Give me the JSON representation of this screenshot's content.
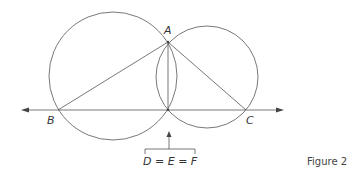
{
  "labels": {
    "A": "A",
    "B": "B",
    "C": "C",
    "equation": "D = E = F"
  },
  "caption": "Figure 2",
  "colors": {
    "stroke": "#444444",
    "text": "#333333"
  }
}
